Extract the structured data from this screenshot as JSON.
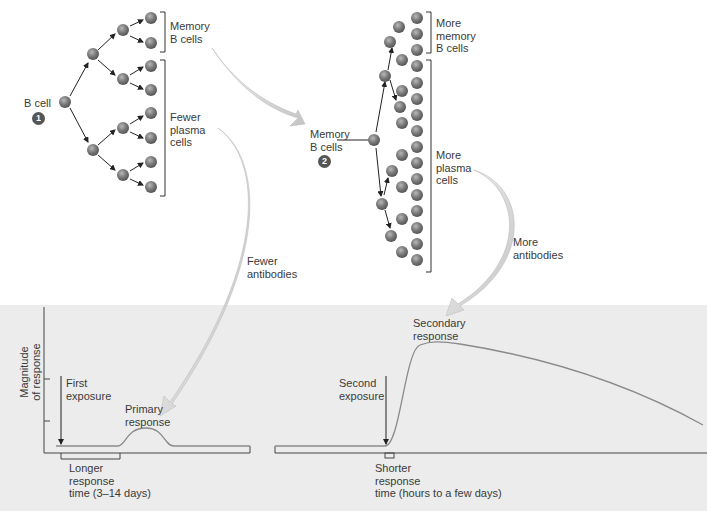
{
  "primary_tree": {
    "start_label": "B cell",
    "step_badge": "1",
    "memory_label": "Memory\nB cells",
    "plasma_label": "Fewer\nplasma\ncells"
  },
  "secondary_tree": {
    "start_label": "Memory\nB cells",
    "step_badge": "2",
    "memory_label": "More\nmemory\nB cells",
    "plasma_label": "More\nplasma\ncells"
  },
  "arrows": {
    "fewer_antibodies": "Fewer\nantibodies",
    "more_antibodies": "More\nantibodies"
  },
  "graph": {
    "y_axis_label": "Magnitude\nof response",
    "first_exposure": "First\nexposure",
    "primary_response": "Primary\nresponse",
    "longer_time": "Longer\nresponse\ntime (3–14 days)",
    "second_exposure": "Second\nexposure",
    "secondary_response": "Secondary\nresponse",
    "shorter_time": "Shorter\nresponse\ntime (hours to a few days)"
  },
  "colors": {
    "panel_bg": "#ececec",
    "cell": "#7a7a7a",
    "arrow_fill": "#d6d6d6",
    "curve": "#8a8a8a",
    "axis": "#4a4a4a"
  }
}
